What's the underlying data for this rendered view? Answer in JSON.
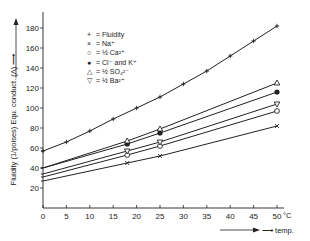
{
  "chart_data": {
    "type": "line",
    "title": "",
    "xlabel": "temp.",
    "xunit": "°C",
    "ylabel": "Fluidity (1/poises) Equ. conduct. (Λ)",
    "xlim": [
      0,
      50
    ],
    "ylim": [
      0,
      180
    ],
    "xticks": [
      0,
      5,
      10,
      15,
      20,
      25,
      30,
      35,
      40,
      45,
      50
    ],
    "yticks": [
      20,
      40,
      60,
      80,
      100,
      120,
      140,
      160,
      180
    ],
    "grid": false,
    "legend_position": "upper-left",
    "series": [
      {
        "name": "Fluidity",
        "marker": "+",
        "x": [
          0,
          5,
          10,
          15,
          20,
          25,
          30,
          35,
          40,
          45,
          50
        ],
        "values": [
          57,
          66,
          77,
          89,
          100,
          111,
          124,
          137,
          152,
          167,
          182
        ]
      },
      {
        "name": "Na⁺",
        "marker": "×",
        "x": [
          0,
          18,
          25,
          50
        ],
        "values": [
          27,
          45,
          52,
          82
        ]
      },
      {
        "name": "½ Ca²⁺",
        "marker": "○",
        "x": [
          0,
          18,
          25,
          50
        ],
        "values": [
          31,
          53,
          62,
          97
        ]
      },
      {
        "name": "Cl⁻ and K⁺",
        "marker": "●",
        "x": [
          0,
          18,
          25,
          50
        ],
        "values": [
          40,
          64,
          75,
          116
        ]
      },
      {
        "name": "½ SO₄²⁻",
        "marker": "△",
        "x": [
          0,
          18,
          25,
          50
        ],
        "values": [
          40,
          67,
          79,
          125
        ]
      },
      {
        "name": "½ Ba²⁺",
        "marker": "▽",
        "x": [
          0,
          18,
          25,
          50
        ],
        "values": [
          34,
          57,
          66,
          104
        ]
      }
    ]
  },
  "legend": [
    {
      "symbol": "+",
      "text": "= Fluidity"
    },
    {
      "symbol": "×",
      "text": "= Na⁺"
    },
    {
      "symbol": "○",
      "text": "= ½ Ca²⁺"
    },
    {
      "symbol": "●",
      "text": "=      Cl⁻ and K⁺"
    },
    {
      "symbol": "△",
      "text": "= ½ SO₄²⁻"
    },
    {
      "symbol": "▽",
      "text": "= ½ Ba²⁺"
    }
  ],
  "axis": {
    "y_label": "Fluidity (1/poises) Equ. conduct. (Λ) ⟶",
    "x_unit": "°C",
    "x_label": "⟶ temp."
  }
}
